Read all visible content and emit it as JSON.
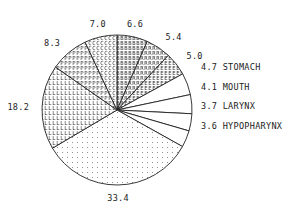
{
  "chart_data": {
    "type": "pie",
    "title": "",
    "start": "top",
    "direction": "clockwise",
    "slices": [
      {
        "value": 6.6,
        "label": "6.6",
        "name": "",
        "fill": "B"
      },
      {
        "value": 5.4,
        "label": "5.4",
        "name": "",
        "fill": "R"
      },
      {
        "value": 5.0,
        "label": "5.0",
        "name": "",
        "fill": "E"
      },
      {
        "value": 4.7,
        "label": "4.7",
        "name": "STOMACH",
        "fill": "none"
      },
      {
        "value": 4.1,
        "label": "4.1",
        "name": "MOUTH",
        "fill": "none"
      },
      {
        "value": 3.7,
        "label": "3.7",
        "name": "LARYNX",
        "fill": "none"
      },
      {
        "value": 3.6,
        "label": "3.6",
        "name": "HYPOPHARYNX",
        "fill": "none"
      },
      {
        "value": 33.4,
        "label": "33.4",
        "name": "",
        "fill": "dots"
      },
      {
        "value": 18.2,
        "label": "18.2",
        "name": "",
        "fill": "L"
      },
      {
        "value": 8.3,
        "label": "8.3",
        "name": "",
        "fill": "P"
      },
      {
        "value": 7.0,
        "label": "7.0",
        "name": "",
        "fill": "C"
      }
    ]
  }
}
